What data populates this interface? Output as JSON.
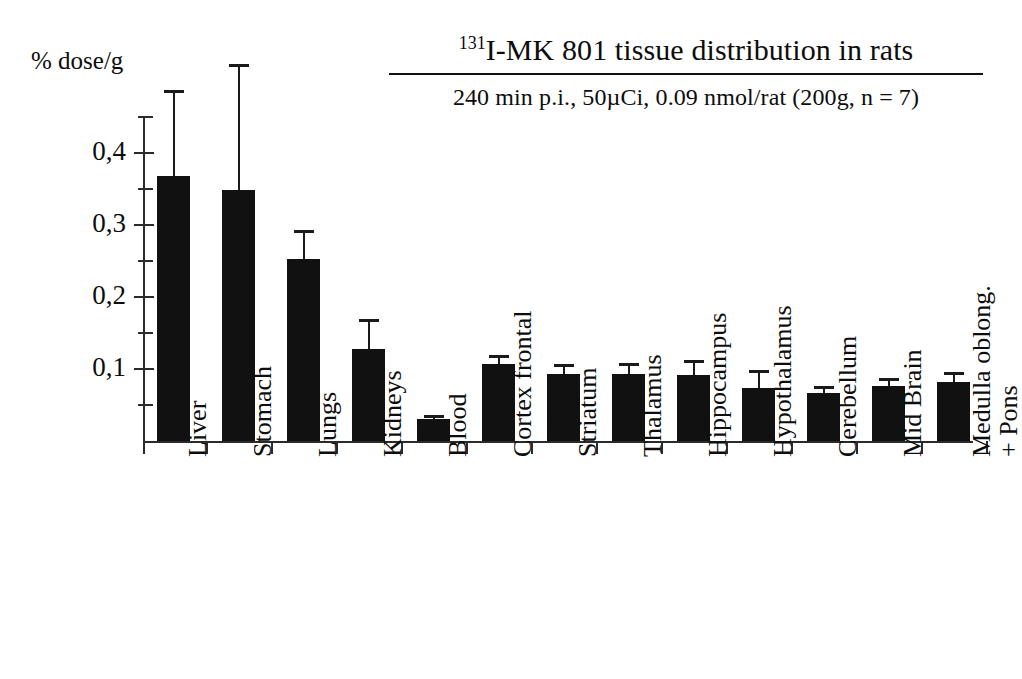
{
  "chart_data": {
    "type": "bar",
    "title": "131I-MK 801 tissue distribution in rats",
    "title_superscript": "131",
    "title_rest": "I-MK 801 tissue distribution in rats",
    "subtitle": "240 min p.i., 50µCi, 0.09 nmol/rat (200g, n = 7)",
    "ylabel": "% dose/g",
    "xlabel": "",
    "ylim": [
      0,
      0.45
    ],
    "grid": false,
    "legend": "none",
    "error_bars": "upper only (SD)",
    "ytick_labels": [
      "0,1",
      "0,2",
      "0,3",
      "0,4"
    ],
    "ytick_values": [
      0.1,
      0.2,
      0.3,
      0.4
    ],
    "yminor_values": [
      0.05,
      0.15,
      0.25,
      0.35,
      0.45
    ],
    "categories": [
      "Liver",
      "Stomach",
      "Lungs",
      "Kidneys",
      "Blood",
      "Cortex frontal",
      "Striatum",
      "Thalamus",
      "Hippocampus",
      "Hypothalamus",
      "Cerebellum",
      "Mid Brain",
      "Medulla oblong.\n+ Pons"
    ],
    "values": [
      0.368,
      0.348,
      0.253,
      0.128,
      0.03,
      0.107,
      0.093,
      0.093,
      0.092,
      0.074,
      0.066,
      0.076,
      0.082
    ],
    "errors": [
      0.12,
      0.175,
      0.04,
      0.042,
      0.006,
      0.013,
      0.014,
      0.016,
      0.021,
      0.025,
      0.011,
      0.012,
      0.014
    ],
    "colors": {
      "bar": "#111111",
      "axis": "#2b2b2b",
      "background": "#ffffff",
      "text": "#0d0d0d"
    }
  }
}
